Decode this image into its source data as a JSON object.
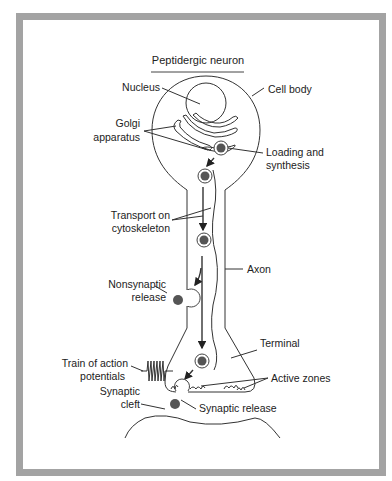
{
  "title": "Peptidergic neuron",
  "labels": {
    "nucleus": "Nucleus",
    "cell_body": "Cell body",
    "golgi_1": "Golgi",
    "golgi_2": "apparatus",
    "loading_1": "Loading and",
    "loading_2": "synthesis",
    "transport_1": "Transport on",
    "transport_2": "cytoskeleton",
    "axon": "Axon",
    "nonsynaptic_1": "Nonsynaptic",
    "nonsynaptic_2": "release",
    "terminal": "Terminal",
    "train_1": "Train of action",
    "train_2": "potentials",
    "active_zones": "Active zones",
    "cleft_1": "Synaptic",
    "cleft_2": "cleft",
    "synaptic_release": "Synaptic release"
  },
  "colors": {
    "frame": "#a3a3a3",
    "line": "#333333",
    "vesicle_core": "#555555"
  }
}
